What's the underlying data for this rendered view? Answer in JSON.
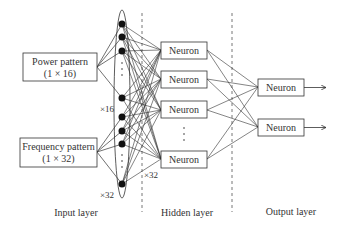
{
  "diagram": {
    "type": "neural-network-architecture",
    "colors": {
      "stroke": "#333333",
      "text": "#333333",
      "node": "#111111",
      "dashed": "#777777",
      "background": "#ffffff"
    },
    "input_boxes": [
      {
        "line1": "Power pattern",
        "line2": "(1 × 16)"
      },
      {
        "line1": "Frequency pattern",
        "line2": "(1 × 32)"
      }
    ],
    "input_group_counts": [
      "×16",
      "×32"
    ],
    "hidden_count_label": "×32",
    "hidden_neurons": [
      "Neuron",
      "Neuron",
      "Neuron",
      "Neuron"
    ],
    "output_neurons": [
      "Neuron",
      "Neuron"
    ],
    "ellipsis": "⋮",
    "layer_labels": {
      "input": "Input layer",
      "hidden": "Hidden layer",
      "output": "Output layer"
    }
  }
}
